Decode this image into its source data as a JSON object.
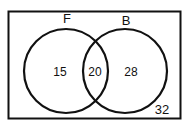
{
  "diagram": {
    "type": "venn",
    "universe_count": "32",
    "sets": [
      {
        "label": "F",
        "only_count": "15"
      },
      {
        "label": "B",
        "only_count": "28"
      }
    ],
    "intersection_count": "20",
    "colors": {
      "stroke": "#111111",
      "background": "#ffffff"
    }
  }
}
